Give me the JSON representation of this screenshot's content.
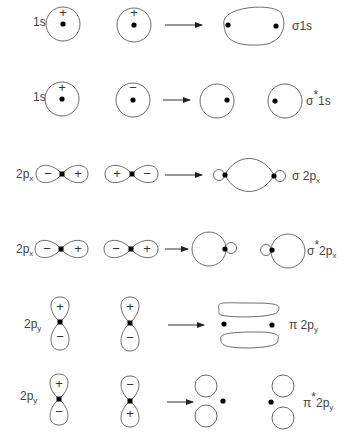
{
  "rows": [
    {
      "ao_label": "1s",
      "ao1_sign": "+",
      "ao2_sign": "+",
      "mo_label": "σ1s",
      "mo_type": "bonding"
    },
    {
      "ao_label": "1s",
      "ao1_sign": "+",
      "ao2_sign": "−",
      "mo_label": "σ*1s",
      "mo_type": "antibonding"
    },
    {
      "ao_label": "2px",
      "ao1_signs": [
        "−",
        "+"
      ],
      "ao2_signs": [
        "+",
        "−"
      ],
      "mo_label": "σ2px",
      "mo_type": "bonding"
    },
    {
      "ao_label": "2px",
      "ao1_signs": [
        "−",
        "+"
      ],
      "ao2_signs": [
        "−",
        "+"
      ],
      "mo_label": "σ*2px",
      "mo_type": "antibonding"
    },
    {
      "ao_label": "2py",
      "ao1_signs": [
        "+",
        "−"
      ],
      "ao2_signs": [
        "+",
        "−"
      ],
      "mo_label": "π2py",
      "mo_type": "bonding"
    },
    {
      "ao_label": "2py",
      "ao1_signs": [
        "+",
        "−"
      ],
      "ao2_signs": [
        "−",
        "+"
      ],
      "mo_label": "π*2py",
      "mo_type": "antibonding"
    }
  ],
  "labels": {
    "r1": {
      "ao": "1s",
      "s1": "+",
      "s2": "+",
      "mo_main": "σ",
      "mo_rest": "1s"
    },
    "r2": {
      "ao": "1s",
      "s1": "+",
      "s2": "−",
      "mo_main": "σ",
      "mo_star": "*",
      "mo_rest": "1s"
    },
    "r3": {
      "ao_main": "2p",
      "ao_sub": "x",
      "a": "−",
      "b": "+",
      "c": "+",
      "d": "−",
      "mo_main": "σ 2p",
      "mo_sub": "x"
    },
    "r4": {
      "ao_main": "2p",
      "ao_sub": "x",
      "a": "−",
      "b": "+",
      "c": "−",
      "d": "+",
      "mo_main": "σ",
      "mo_star": "*",
      "mo_rest": "2p",
      "mo_sub": "x"
    },
    "r5": {
      "ao_main": "2p",
      "ao_sub": "y",
      "a": "+",
      "b": "−",
      "c": "+",
      "d": "−",
      "mo_main": "π 2p",
      "mo_sub": "y"
    },
    "r6": {
      "ao_main": "2p",
      "ao_sub": "y",
      "a": "+",
      "b": "−",
      "c": "−",
      "d": "+",
      "mo_main": "π",
      "mo_star": "*",
      "mo_rest": "2p",
      "mo_sub": "y"
    }
  }
}
